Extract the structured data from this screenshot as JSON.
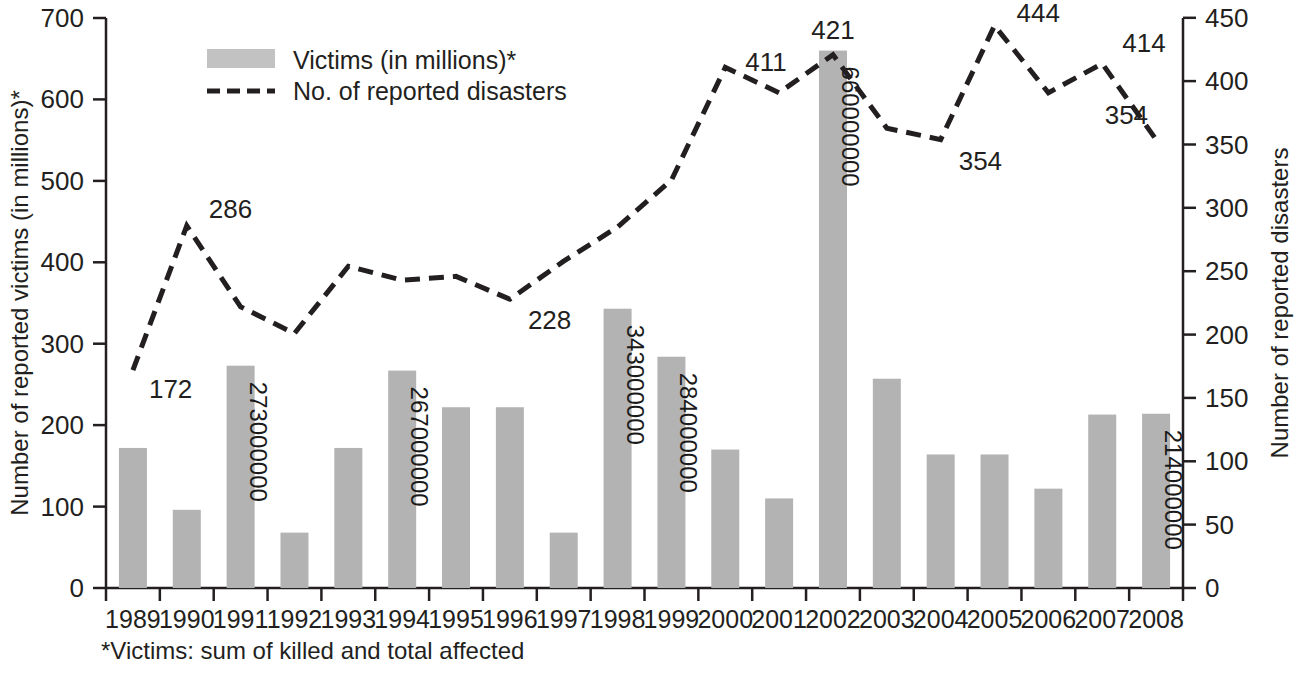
{
  "chart_data": {
    "type": "bar",
    "title": "",
    "subtitle": "",
    "categories": [
      "1989",
      "1990",
      "1991",
      "1992",
      "1993",
      "1994",
      "1995",
      "1996",
      "1997",
      "1998",
      "1999",
      "2000",
      "2001",
      "2002",
      "2003",
      "2004",
      "2005",
      "2006",
      "2007",
      "2008"
    ],
    "series": [
      {
        "name": "Victims (in millions)*",
        "type": "bar",
        "axis": "left",
        "color": "#b3b3b3",
        "values": [
          172,
          96,
          273,
          68,
          172,
          267,
          222,
          222,
          68,
          343,
          284,
          170,
          110,
          660,
          257,
          164,
          164,
          122,
          213,
          214
        ],
        "data_labels": {
          "1991": "273000000",
          "1994": "267000000",
          "1998": "343000000",
          "1999": "284000000",
          "2002": "660000000",
          "2008": "214000000"
        }
      },
      {
        "name": "No. of reported disasters",
        "type": "line",
        "style": "dashed",
        "axis": "right",
        "color": "#231f20",
        "values": [
          172,
          286,
          222,
          201,
          254,
          243,
          246,
          228,
          258,
          285,
          322,
          411,
          391,
          421,
          363,
          354,
          444,
          391,
          414,
          354
        ],
        "data_labels": {
          "1989": "172",
          "1990": "286",
          "1996": "228",
          "2000": "411",
          "2002": "421",
          "2004": "354",
          "2005": "444",
          "2007": "414",
          "2008": "354"
        }
      }
    ],
    "xlabel": "",
    "left_axis": {
      "label": "Number of reported victims (in millions)*",
      "ticks": [
        0,
        100,
        200,
        300,
        400,
        500,
        600,
        700
      ],
      "ylim": [
        0,
        700
      ]
    },
    "right_axis": {
      "label": "Number of reported disasters",
      "ticks": [
        0,
        50,
        100,
        150,
        200,
        250,
        300,
        350,
        400,
        450
      ],
      "ylim": [
        0,
        450
      ]
    },
    "grid": false,
    "legend": {
      "position": "top-left-inside",
      "entries": [
        {
          "label": "Victims (in millions)*",
          "marker": "bar-swatch"
        },
        {
          "label": "No. of reported disasters",
          "marker": "dashed-line"
        }
      ]
    },
    "footnote": "*Victims: sum of killed and total affected"
  }
}
